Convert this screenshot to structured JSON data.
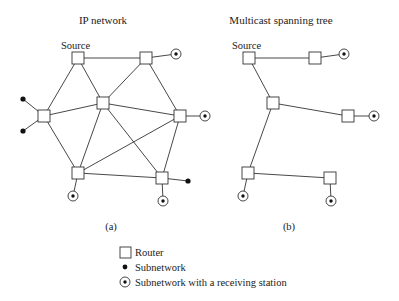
{
  "panels": [
    {
      "title": "IP network",
      "caption": "(a)",
      "source_label": "Source"
    },
    {
      "title": "Multicast spanning tree",
      "caption": "(b)",
      "source_label": "Source"
    }
  ],
  "legend": {
    "items": [
      {
        "icon": "router-square-icon",
        "label": "Router"
      },
      {
        "icon": "subnetwork-dot-icon",
        "label": "Subnetwork"
      },
      {
        "icon": "receiving-station-icon",
        "label": "Subnetwork with a receiving station"
      }
    ]
  },
  "diagram": {
    "network_a": {
      "routers": [
        "source",
        "top_right",
        "center",
        "left",
        "right",
        "bottom_left",
        "bottom_right"
      ],
      "links": [
        [
          "source",
          "top_right"
        ],
        [
          "source",
          "left"
        ],
        [
          "source",
          "center"
        ],
        [
          "top_right",
          "center"
        ],
        [
          "top_right",
          "right"
        ],
        [
          "left",
          "center"
        ],
        [
          "left",
          "bottom_left"
        ],
        [
          "center",
          "right"
        ],
        [
          "center",
          "bottom_left"
        ],
        [
          "center",
          "bottom_right"
        ],
        [
          "right",
          "bottom_left"
        ],
        [
          "right",
          "bottom_right"
        ],
        [
          "bottom_left",
          "bottom_right"
        ]
      ],
      "subnetworks": [
        "left (2)",
        "bottom_right (1)"
      ],
      "receiving_stations": [
        "top_right",
        "right",
        "bottom_left",
        "bottom_right"
      ]
    },
    "tree_b": {
      "links": [
        [
          "source",
          "top_right"
        ],
        [
          "source",
          "center"
        ],
        [
          "center",
          "right"
        ],
        [
          "center",
          "bottom_left"
        ],
        [
          "bottom_left",
          "bottom_right"
        ]
      ],
      "receiving_stations": [
        "top_right",
        "right",
        "bottom_left",
        "bottom_right"
      ]
    }
  }
}
